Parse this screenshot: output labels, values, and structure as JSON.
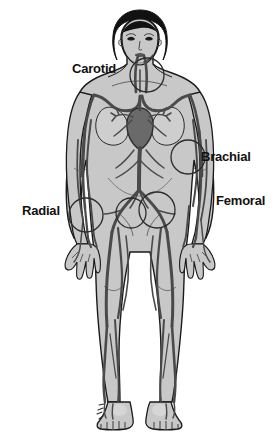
{
  "diagram": {
    "background_color": "#ffffff",
    "body_fill_color": "#c8c8c8",
    "vessel_color": "#4a4a4a",
    "outline_color": "#1a1a1a",
    "hair_color": "#111111",
    "label_color": "#111111",
    "marker_stroke_color": "#2b2b2b"
  },
  "labels": {
    "carotid": "Carotid",
    "brachial": "Brachial",
    "femoral": "Femoral",
    "radial": "Radial"
  },
  "pulse_points": [
    {
      "name": "carotid",
      "label": "Carotid",
      "cx": 147,
      "cy": 75,
      "r": 17,
      "label_x": 72,
      "label_y": 62
    },
    {
      "name": "brachial",
      "label": "Brachial",
      "cx": 188,
      "cy": 157,
      "r": 17,
      "label_x": 201,
      "label_y": 150
    },
    {
      "name": "femoral",
      "label": "Femoral",
      "cx": 157,
      "cy": 210,
      "r": 18,
      "label_x": 216,
      "label_y": 194
    },
    {
      "name": "femoral-left",
      "label": "Femoral",
      "cx": 131,
      "cy": 213,
      "r": 15,
      "label_x": null,
      "label_y": null
    },
    {
      "name": "radial",
      "label": "Radial",
      "cx": 86,
      "cy": 215,
      "r": 17,
      "label_x": 22,
      "label_y": 204
    }
  ]
}
